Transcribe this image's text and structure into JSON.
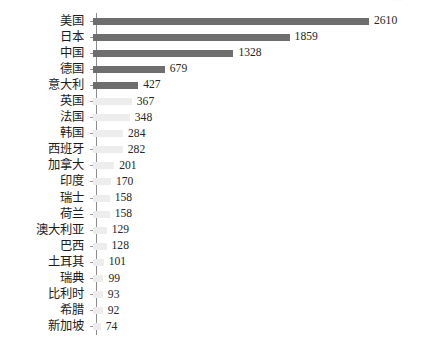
{
  "clipped_header_text": "世界各国工业机器人保有量（台）国际机器人联合会（IFR）统计数据",
  "colors": {
    "bar_dark": "#6e6e6e",
    "bar_light": "#ededed",
    "axis": "#8c8c8c",
    "tick": "#9a9a9a",
    "text": "#1c1c1c",
    "background": "#ffffff"
  },
  "chart_data": {
    "type": "bar",
    "orientation": "horizontal",
    "title": "",
    "xlabel": "",
    "ylabel": "",
    "grid": false,
    "legend": false,
    "xlim": [
      0,
      2610
    ],
    "categories": [
      "美国",
      "日本",
      "中国",
      "德国",
      "意大利",
      "英国",
      "法国",
      "韩国",
      "西班牙",
      "加拿大",
      "印度",
      "瑞士",
      "荷兰",
      "澳大利亚",
      "巴西",
      "土耳其",
      "瑞典",
      "比利时",
      "希腊",
      "新加坡"
    ],
    "values": [
      2610,
      1859,
      1328,
      679,
      427,
      367,
      348,
      284,
      282,
      201,
      170,
      158,
      158,
      129,
      128,
      101,
      99,
      93,
      92,
      74
    ],
    "highlighted_count": 5
  }
}
